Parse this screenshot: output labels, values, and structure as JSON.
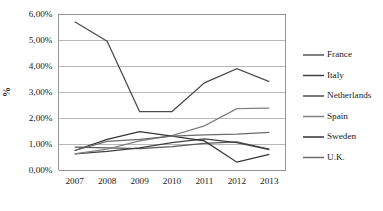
{
  "chart_data": {
    "type": "line",
    "title": "",
    "xlabel": "",
    "ylabel": "%",
    "categories": [
      "2007",
      "2008",
      "2009",
      "2010",
      "2011",
      "2012",
      "2013"
    ],
    "x": [
      2007,
      2008,
      2009,
      2010,
      2011,
      2012,
      2013
    ],
    "ylim": [
      0,
      6
    ],
    "ytick_values": [
      0,
      1,
      2,
      3,
      4,
      5,
      6
    ],
    "ytick_labels": [
      "0,00%",
      "1,00%",
      "2,00%",
      "3,00%",
      "4,00%",
      "5,00%",
      "6,00%"
    ],
    "grid": true,
    "legend_position": "right",
    "series": [
      {
        "name": "France",
        "color": "#595959",
        "values": [
          0.88,
          0.85,
          0.82,
          0.9,
          1.02,
          1.08,
          0.8
        ]
      },
      {
        "name": "Italy",
        "color": "#404040",
        "values": [
          0.62,
          0.72,
          0.85,
          1.05,
          1.2,
          1.05,
          0.78
        ]
      },
      {
        "name": "Netherlands",
        "color": "#4d4d4d",
        "values": [
          5.7,
          4.95,
          2.25,
          2.25,
          3.35,
          3.9,
          3.4
        ]
      },
      {
        "name": "Spain",
        "color": "#808080",
        "values": [
          0.62,
          0.8,
          1.12,
          1.32,
          1.7,
          2.36,
          2.38
        ]
      },
      {
        "name": "Sweden",
        "color": "#333333",
        "values": [
          0.75,
          1.18,
          1.48,
          1.3,
          1.12,
          0.3,
          0.6
        ]
      },
      {
        "name": "U.K.",
        "color": "#6b6b6b",
        "values": [
          0.75,
          1.1,
          1.18,
          1.3,
          1.35,
          1.38,
          1.45
        ]
      }
    ],
    "steep_drop_series": "Spain",
    "annotations": []
  },
  "legend": {
    "items": [
      "France",
      "Italy",
      "Netherlands",
      "Spain",
      "Sweden",
      "U.K."
    ]
  },
  "axis": {
    "y_title": "%"
  }
}
